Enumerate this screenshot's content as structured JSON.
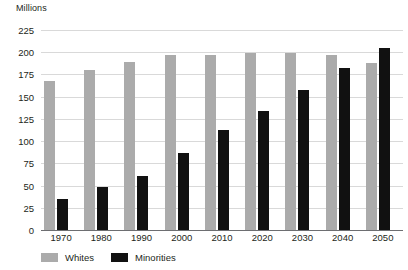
{
  "chart_data": {
    "type": "bar",
    "title": "",
    "subtitle": "",
    "xlabel": "",
    "ylabel": "Millions",
    "unit_label": "Millions",
    "categories": [
      "1970",
      "1980",
      "1990",
      "2000",
      "2010",
      "2020",
      "2030",
      "2040",
      "2050"
    ],
    "series": [
      {
        "name": "Whites",
        "color": "#ababab",
        "values": [
          168,
          180,
          189,
          197,
          197,
          199,
          199,
          197,
          188
        ]
      },
      {
        "name": "Minorities",
        "color": "#111111",
        "values": [
          35,
          48,
          61,
          87,
          113,
          134,
          158,
          182,
          205
        ]
      }
    ],
    "ylim": [
      0,
      225
    ],
    "yticks": [
      0,
      25,
      50,
      75,
      100,
      125,
      150,
      175,
      200,
      225
    ],
    "ytick_labels": [
      "0",
      "25",
      "50",
      "75",
      "100",
      "125",
      "150",
      "175",
      "200",
      "225"
    ],
    "grid": true,
    "grid_color": "#d9d9d9",
    "axis_color": "#6d6e71",
    "legend_position": "bottom-left",
    "legend": [
      {
        "label": "Whites",
        "color": "#ababab",
        "swatch": "legend-swatch-whites"
      },
      {
        "label": "Minorities",
        "color": "#111111",
        "swatch": "legend-swatch-minorities"
      }
    ]
  }
}
